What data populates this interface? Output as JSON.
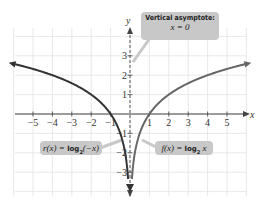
{
  "chart_data": {
    "type": "line",
    "title": "",
    "xlabel": "x",
    "ylabel": "y",
    "xlim": [
      -6,
      6
    ],
    "ylim": [
      -4,
      4.5
    ],
    "grid": true,
    "x_ticks": [
      -5,
      -4,
      -3,
      -2,
      -1,
      1,
      2,
      3,
      4,
      5
    ],
    "y_ticks": [
      -3,
      -2,
      -1,
      1,
      2,
      3
    ],
    "series": [
      {
        "name": "r(x) = log2(-x)",
        "color": "#333333",
        "function": "log2(-x)",
        "domain": [
          -6,
          0
        ],
        "points": [
          [
            -6,
            2.585
          ],
          [
            -5,
            2.322
          ],
          [
            -4,
            2
          ],
          [
            -3,
            1.585
          ],
          [
            -2,
            1
          ],
          [
            -1,
            0
          ],
          [
            -0.5,
            -1
          ],
          [
            -0.25,
            -2
          ],
          [
            -0.125,
            -3
          ]
        ]
      },
      {
        "name": "f(x) = log2 x",
        "color": "#666666",
        "function": "log2(x)",
        "domain": [
          0,
          6
        ],
        "points": [
          [
            0.125,
            -3
          ],
          [
            0.25,
            -2
          ],
          [
            0.5,
            -1
          ],
          [
            1,
            0
          ],
          [
            2,
            1
          ],
          [
            3,
            1.585
          ],
          [
            4,
            2
          ],
          [
            5,
            2.322
          ],
          [
            6,
            2.585
          ]
        ]
      }
    ],
    "annotations": [
      {
        "text": "Vertical asymptote: x = 0",
        "target": "y-axis"
      },
      {
        "text": "r(x) = log2(-x)",
        "target": "left curve"
      },
      {
        "text": "f(x) = log2 x",
        "target": "right curve"
      }
    ]
  },
  "labels": {
    "x_axis": "x",
    "y_axis": "y",
    "asymptote_title": "Vertical asymptote:",
    "asymptote_eq": "x = 0",
    "r_prefix": "r(x) = ",
    "r_log": "log",
    "r_sub": "2",
    "r_arg": "(−x)",
    "f_prefix": "f(x) = ",
    "f_log": "log",
    "f_sub": "2",
    "f_arg": " x",
    "x_ticks": [
      "−5",
      "−4",
      "−3",
      "−2",
      "−1",
      "1",
      "2",
      "3",
      "4",
      "5"
    ],
    "y_ticks_pos": [
      "1",
      "2",
      "3"
    ],
    "y_ticks_neg": [
      "−1",
      "−2",
      "−3"
    ]
  }
}
